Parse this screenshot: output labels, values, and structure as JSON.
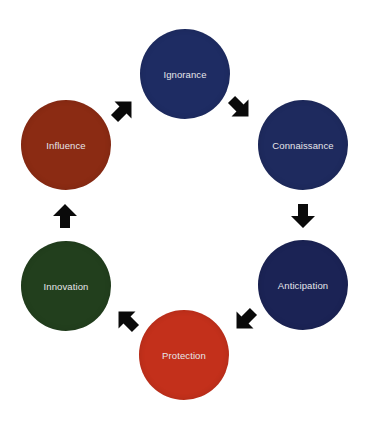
{
  "diagram": {
    "type": "cycle",
    "nodes": [
      {
        "id": "ignorance",
        "label": "Ignorance",
        "color": "#1e2c63",
        "cx": 185,
        "cy": 74
      },
      {
        "id": "connaissance",
        "label": "Connaissance",
        "color": "#1e2a5e",
        "cx": 303,
        "cy": 145
      },
      {
        "id": "anticipation",
        "label": "Anticipation",
        "color": "#1b2355",
        "cx": 303,
        "cy": 285
      },
      {
        "id": "protection",
        "label": "Protection",
        "color": "#c3301b",
        "cx": 184,
        "cy": 355
      },
      {
        "id": "innovation",
        "label": "Innovation",
        "color": "#223f1d",
        "cx": 66,
        "cy": 286
      },
      {
        "id": "influence",
        "label": "Influence",
        "color": "#8b2b13",
        "cx": 66,
        "cy": 145
      }
    ],
    "arrows": [
      {
        "id": "arrow-ignorance-to-connaissance",
        "from": "Ignorance",
        "to": "Connaissance",
        "direction": "down-right",
        "color": "#0a0a0a"
      },
      {
        "id": "arrow-connaissance-to-anticipation",
        "from": "Connaissance",
        "to": "Anticipation",
        "direction": "down",
        "color": "#0a0a0a"
      },
      {
        "id": "arrow-anticipation-to-protection",
        "from": "Anticipation",
        "to": "Protection",
        "direction": "down-left",
        "color": "#0a0a0a"
      },
      {
        "id": "arrow-protection-to-innovation",
        "from": "Protection",
        "to": "Innovation",
        "direction": "up-left",
        "color": "#0a0a0a"
      },
      {
        "id": "arrow-innovation-to-influence",
        "from": "Innovation",
        "to": "Influence",
        "direction": "up",
        "color": "#0a0a0a"
      },
      {
        "id": "arrow-influence-to-ignorance",
        "from": "Influence",
        "to": "Ignorance",
        "direction": "up-right",
        "color": "#0a0a0a"
      }
    ]
  }
}
